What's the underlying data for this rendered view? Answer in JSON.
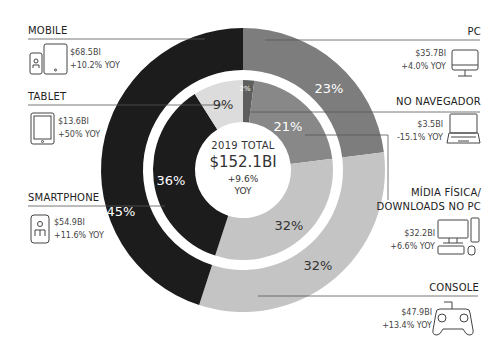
{
  "center": {
    "title": "2019 TOTAL",
    "total": "$152.1BI",
    "growth": "+9.6%",
    "growth_suffix": "YOY"
  },
  "segments": {
    "mobile": {
      "label": "MOBILE",
      "value": "$68.5BI",
      "yoy": "+10.2% YOY",
      "pct": "45%"
    },
    "tablet": {
      "label": "TABLET",
      "value": "$13.6BI",
      "yoy": "+50% YOY",
      "pct": "9%"
    },
    "smartphone": {
      "label": "SMARTPHONE",
      "value": "$54.9BI",
      "yoy": "+11.6% YOY",
      "pct": "36%"
    },
    "pc": {
      "label": "PC",
      "value": "$35.7BI",
      "yoy": "+4.0% YOY",
      "pct": "23%"
    },
    "browser": {
      "label": "NO NAVEGADOR",
      "value": "$3.5BI",
      "yoy": "-15.1% YOY",
      "pct": "2%"
    },
    "physical": {
      "label_line1": "MÍDIA FÍSICA/",
      "label_line2": "DOWNLOADS NO PC",
      "value": "$32.2BI",
      "yoy": "+6.6% YOY",
      "pct": "21%"
    },
    "console": {
      "label": "CONSOLE",
      "value": "$47.9BI",
      "yoy": "+13.4% YOY",
      "pct_outer": "32%",
      "pct_inner": "32%"
    }
  },
  "colors": {
    "mobile": "#1c1c1c",
    "pc": "#7d7d7d",
    "console": "#c4c4c4",
    "tablet": "#dcdcdc",
    "browser": "#5e5e5e",
    "physical": "#888888"
  },
  "chart_data": {
    "type": "pie",
    "title": "2019 TOTAL $152.1BI +9.6% YOY",
    "rings": [
      {
        "name": "outer",
        "categories": [
          "PC",
          "Console",
          "Mobile"
        ],
        "values": [
          23,
          32,
          45
        ],
        "revenue": [
          "$35.7BI",
          "$47.9BI",
          "$68.5BI"
        ],
        "yoy": [
          "+4.0%",
          "+13.4%",
          "+10.2%"
        ]
      },
      {
        "name": "inner",
        "categories": [
          "No Navegador",
          "Mídia Física/Downloads no PC",
          "Console",
          "Smartphone",
          "Tablet"
        ],
        "values": [
          2,
          21,
          32,
          36,
          9
        ],
        "revenue": [
          "$3.5BI",
          "$32.2BI",
          "$47.9BI",
          "$54.9BI",
          "$13.6BI"
        ],
        "yoy": [
          "-15.1%",
          "+6.6%",
          "+13.4%",
          "+11.6%",
          "+5.0%"
        ]
      }
    ],
    "legend_position": "both sides"
  }
}
